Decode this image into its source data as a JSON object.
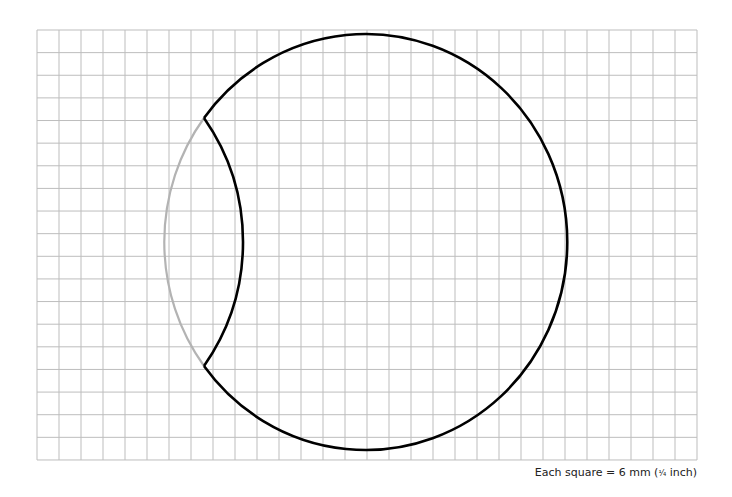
{
  "diagram": {
    "type": "grid-paper-shape",
    "grid": {
      "x0": 37,
      "y0": 30,
      "columns": 30,
      "rows": 19,
      "cell_w": 22,
      "cell_h": 22.63,
      "line_color": "#bdbdbd"
    },
    "outer_circle": {
      "cx": 367,
      "cy": 243,
      "rx": 201.5,
      "ry": 208,
      "stroke": "#000000",
      "stroke_width": 2.6
    },
    "cutout_arc_gray": {
      "description": "left portion of circle drawn in gray (removed region)",
      "stroke": "#b3b3b3",
      "stroke_width": 2.2
    },
    "inner_arc": {
      "description": "concave cut from upper cusp to lower cusp",
      "start": [
        204,
        118
      ],
      "apex": [
        243,
        243
      ],
      "end": [
        204,
        366
      ],
      "radius": 216.6,
      "stroke": "#000000",
      "stroke_width": 2.6
    }
  },
  "caption": {
    "prefix": "Each square = 6 mm (",
    "fraction": "¹⁄₄",
    "suffix": " inch)"
  }
}
